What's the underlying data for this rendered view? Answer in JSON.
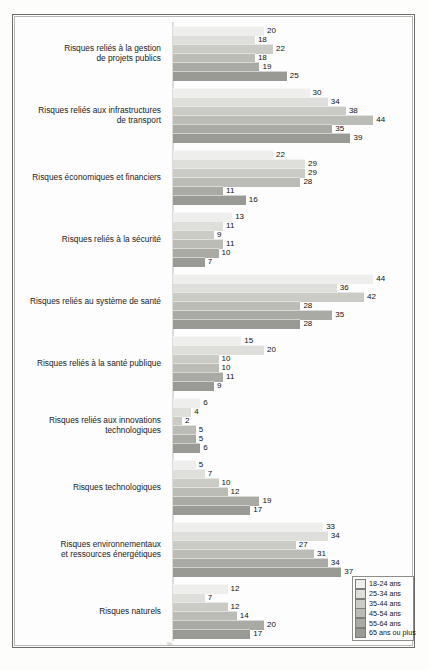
{
  "chart_data": {
    "type": "bar",
    "orientation": "horizontal",
    "title": "",
    "xlabel": "%",
    "ylabel": "",
    "xlim": [
      0,
      50
    ],
    "grid": false,
    "legend_position": "bottom-right",
    "categories": [
      "Risques reliés à la gestion\nde projets publics",
      "Risques reliés aux infrastructures\nde transport",
      "Risques économiques et financiers",
      "Risques reliés à la sécurité",
      "Risques reliés au système de santé",
      "Risques reliés à la santé publique",
      "Risques reliés aux innovations\ntechnologiques",
      "Risques technologiques",
      "Risques environnementaux\net ressources énergétiques",
      "Risques naturels"
    ],
    "series": [
      {
        "name": "18-24 ans",
        "color": "#eeeeec",
        "values": [
          20,
          30,
          22,
          13,
          44,
          15,
          6,
          5,
          33,
          12
        ]
      },
      {
        "name": "25-34 ans",
        "color": "#dededa",
        "values": [
          18,
          34,
          29,
          11,
          36,
          20,
          4,
          7,
          34,
          7
        ]
      },
      {
        "name": "35-44 ans",
        "color": "#cbcbc6",
        "values": [
          22,
          38,
          29,
          9,
          42,
          10,
          2,
          10,
          27,
          12
        ]
      },
      {
        "name": "45-54 ans",
        "color": "#bcbcb6",
        "values": [
          18,
          44,
          28,
          11,
          28,
          10,
          5,
          12,
          31,
          14
        ]
      },
      {
        "name": "55-64 ans",
        "color": "#aaaaa4",
        "values": [
          19,
          35,
          11,
          10,
          35,
          11,
          5,
          19,
          34,
          20
        ]
      },
      {
        "name": "65 ans ou plus",
        "color": "#9a9a94",
        "values": [
          25,
          39,
          16,
          7,
          28,
          9,
          6,
          17,
          37,
          17
        ]
      }
    ]
  },
  "legend": {
    "items": [
      {
        "label": "18-24 ans"
      },
      {
        "label": "25-34 ans"
      },
      {
        "label": "35-44 ans"
      },
      {
        "label": "45-54 ans"
      },
      {
        "label": "55-64 ans"
      },
      {
        "label": "65 ans ou plus"
      }
    ]
  },
  "axis": {
    "unit_label": "%"
  }
}
